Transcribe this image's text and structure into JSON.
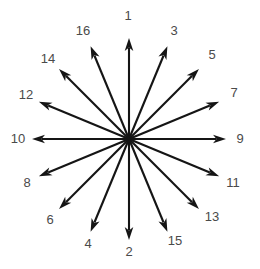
{
  "figure": {
    "type": "radial-arrow-diagram",
    "title": "",
    "width": 260,
    "height": 269,
    "background_color": "#ffffff",
    "arrow_color": "#151515",
    "label_color": "#4a4a4a",
    "center": {
      "x": 129,
      "y": 139
    },
    "arrow_count": 16,
    "angular_spacing_degrees": 22.5,
    "radius_x": 97,
    "radius_y": 101,
    "label_radius_x": 115,
    "label_radius_y": 119
  },
  "chart_data": {
    "type": "scatter",
    "title": "",
    "xlabel": "",
    "ylabel": "",
    "legend_position": "none",
    "grid": false,
    "categories": [
      "1",
      "2",
      "3",
      "4",
      "5",
      "6",
      "7",
      "8",
      "9",
      "10",
      "11",
      "12",
      "13",
      "14",
      "15",
      "16"
    ],
    "arrows": [
      {
        "label": "1",
        "angle_deg": 90.0,
        "label_x": 128,
        "label_y": 15
      },
      {
        "label": "2",
        "angle_deg": 270.0,
        "label_x": 129,
        "label_y": 251
      },
      {
        "label": "3",
        "angle_deg": 67.5,
        "label_x": 174,
        "label_y": 30
      },
      {
        "label": "4",
        "angle_deg": 247.5,
        "label_x": 88,
        "label_y": 243
      },
      {
        "label": "5",
        "angle_deg": 45.0,
        "label_x": 212,
        "label_y": 54
      },
      {
        "label": "6",
        "angle_deg": 225.0,
        "label_x": 50,
        "label_y": 219
      },
      {
        "label": "7",
        "angle_deg": 22.5,
        "label_x": 234,
        "label_y": 92
      },
      {
        "label": "8",
        "angle_deg": 202.5,
        "label_x": 27,
        "label_y": 182
      },
      {
        "label": "9",
        "angle_deg": 0.0,
        "label_x": 240,
        "label_y": 138
      },
      {
        "label": "10",
        "angle_deg": 180.0,
        "label_x": 18,
        "label_y": 138
      },
      {
        "label": "11",
        "angle_deg": 337.5,
        "label_x": 233,
        "label_y": 182
      },
      {
        "label": "12",
        "angle_deg": 157.5,
        "label_x": 26,
        "label_y": 94
      },
      {
        "label": "13",
        "angle_deg": 315.0,
        "label_x": 212,
        "label_y": 216
      },
      {
        "label": "14",
        "angle_deg": 135.0,
        "label_x": 48,
        "label_y": 58
      },
      {
        "label": "15",
        "angle_deg": 292.5,
        "label_x": 175,
        "label_y": 240
      },
      {
        "label": "16",
        "angle_deg": 112.5,
        "label_x": 83,
        "label_y": 30
      }
    ]
  }
}
